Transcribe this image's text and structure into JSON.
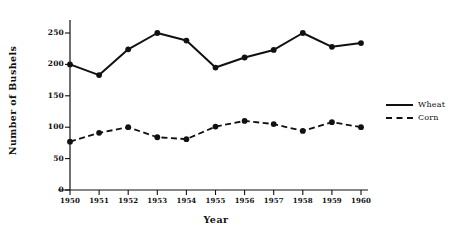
{
  "chart_data": {
    "type": "line",
    "title": "",
    "xlabel": "Year",
    "ylabel": "Number of Bushels",
    "x": [
      1950,
      1951,
      1952,
      1953,
      1954,
      1955,
      1956,
      1957,
      1958,
      1959,
      1960
    ],
    "categories": [
      "1950",
      "1951",
      "1952",
      "1953",
      "1954",
      "1955",
      "1956",
      "1957",
      "1958",
      "1959",
      "1960"
    ],
    "series": [
      {
        "name": "Wheat",
        "style": "solid",
        "marker": "filled-circle",
        "color": "#111111",
        "values": [
          200,
          183,
          224,
          250,
          238,
          195,
          211,
          223,
          250,
          228,
          234
        ]
      },
      {
        "name": "Corn",
        "style": "dashed",
        "marker": "filled-circle",
        "color": "#111111",
        "values": [
          77,
          91,
          100,
          84,
          81,
          101,
          110,
          105,
          94,
          108,
          100
        ]
      }
    ],
    "ylim": [
      0,
      262
    ],
    "xlim": [
      1949.6,
      1960.4
    ],
    "yticks": [
      0,
      50,
      100,
      150,
      200,
      250
    ],
    "ytick_labels": [
      "0",
      "50",
      "100",
      "150",
      "200",
      "250"
    ],
    "grid": false,
    "legend_position": "right",
    "legend_entries": [
      "Wheat",
      "Corn"
    ]
  }
}
